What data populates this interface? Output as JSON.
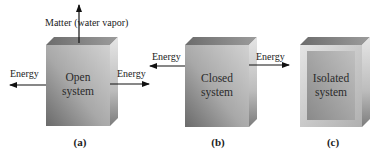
{
  "figure": {
    "panels": [
      {
        "id": "a",
        "caption": "(a)",
        "system_line1": "Open",
        "system_line2": "system",
        "energy_left": "Energy",
        "energy_right": "Energy",
        "matter": "Matter (water vapor)"
      },
      {
        "id": "b",
        "caption": "(b)",
        "system_line1": "Closed",
        "system_line2": "system",
        "energy_left": "Energy",
        "energy_right": "Energy"
      },
      {
        "id": "c",
        "caption": "(c)",
        "system_line1": "Isolated",
        "system_line2": "system"
      }
    ],
    "colors": {
      "front_light": "#c4c4c4",
      "front_dark": "#6e6e6e",
      "top": "#8a8a8a",
      "side_light": "#d8d8d8",
      "side_dark": "#7a7a7a",
      "arrow": "#111111"
    }
  }
}
